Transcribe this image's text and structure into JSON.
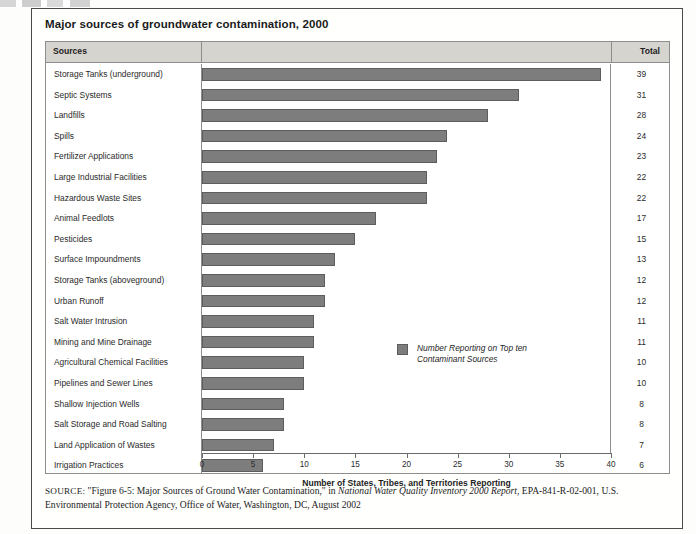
{
  "figure": {
    "title": "Major sources of groundwater contamination, 2000"
  },
  "table": {
    "header": {
      "sources": "Sources",
      "total": "Total"
    }
  },
  "legend": {
    "label": "Number Reporting on Top ten\nContaminant Sources",
    "swatch_color": "#7d7d7d"
  },
  "source_note": {
    "prefix": "SOURCE:",
    "quoted": "\"Figure 6-5: Major Sources of Ground Water Contamination,\"",
    "connector": " in ",
    "italic_title": "National Water Quality Inventory 2000 Report",
    "tail": ", EPA-841-R-02-001, U.S. Environmental Protection Agency, Office of Water, Washington, DC, August 2002"
  },
  "chart_data": {
    "type": "bar",
    "orientation": "horizontal",
    "title": "Major sources of groundwater contamination, 2000",
    "xlabel": "Number of States, Tribes, and Territories Reporting",
    "ylabel": "Sources",
    "xlim": [
      0,
      40
    ],
    "xticks": [
      0,
      5,
      10,
      15,
      20,
      25,
      30,
      35,
      40
    ],
    "grid": false,
    "legend_position": "inside-right",
    "series_name": "Number Reporting on Top ten Contaminant Sources",
    "categories": [
      "Storage Tanks (underground)",
      "Septic Systems",
      "Landfills",
      "Spills",
      "Fertilizer Applications",
      "Large Industrial Facilities",
      "Hazardous Waste Sites",
      "Animal Feedlots",
      "Pesticides",
      "Surface Impoundments",
      "Storage Tanks (aboveground)",
      "Urban Runoff",
      "Salt Water Intrusion",
      "Mining and Mine Drainage",
      "Agricultural Chemical Facilities",
      "Pipelines and Sewer Lines",
      "Shallow Injection Wells",
      "Salt Storage and Road Salting",
      "Land Application of Wastes",
      "Irrigation Practices"
    ],
    "values": [
      39,
      31,
      28,
      24,
      23,
      22,
      22,
      17,
      15,
      13,
      12,
      12,
      11,
      11,
      10,
      10,
      8,
      8,
      7,
      6
    ]
  }
}
